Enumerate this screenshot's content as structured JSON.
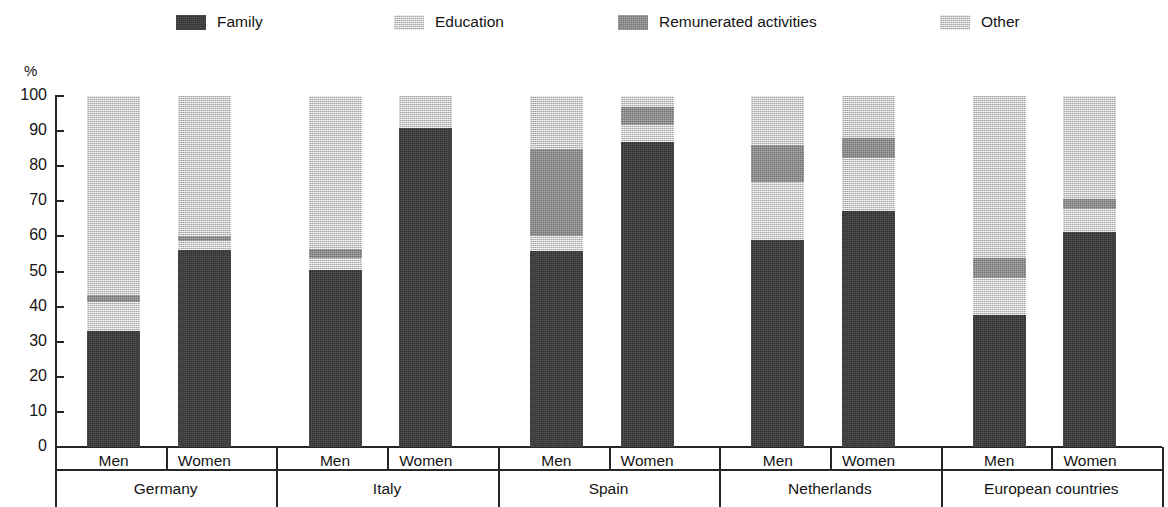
{
  "legend": {
    "items": [
      {
        "label": "Family",
        "color": "#3a3a3a",
        "icon": "legend-swatch-icon",
        "x": 176
      },
      {
        "label": "Education",
        "color": "#d5d5d5",
        "icon": "legend-swatch-icon",
        "x": 394
      },
      {
        "label": "Remunerated activities",
        "color": "#8d8d8d",
        "icon": "legend-swatch-icon",
        "x": 618
      },
      {
        "label": "Other",
        "color": "#d3d3d3",
        "icon": "legend-swatch-icon",
        "x": 940
      }
    ]
  },
  "axis": {
    "unit_label": "%",
    "y_ticks": [
      "100",
      "90",
      "80",
      "70",
      "60",
      "50",
      "40",
      "30",
      "20",
      "10",
      "0"
    ],
    "y_min": 0,
    "y_max": 100
  },
  "x_axis": {
    "sex_labels": [
      "Men",
      "Women",
      "Men",
      "Women",
      "Men",
      "Women",
      "Men",
      "Women",
      "Men",
      "Women"
    ],
    "group_labels": [
      "Germany",
      "Italy",
      "Spain",
      "Netherlands",
      "European countries"
    ]
  },
  "chart_data": {
    "type": "bar",
    "stacked": true,
    "title": "",
    "xlabel": "",
    "ylabel": "%",
    "ylim": [
      0,
      100
    ],
    "grid": false,
    "legend_position": "top",
    "categories": [
      "Germany - Men",
      "Germany - Women",
      "Italy - Men",
      "Italy - Women",
      "Spain - Men",
      "Spain - Women",
      "Netherlands - Men",
      "Netherlands - Women",
      "European countries - Men",
      "European countries - Women"
    ],
    "groups": [
      "Germany",
      "Italy",
      "Spain",
      "Netherlands",
      "European countries"
    ],
    "sexes": [
      "Men",
      "Women"
    ],
    "series": [
      {
        "name": "Family",
        "color": "#3a3a3a",
        "values": [
          33.0,
          56.0,
          50.5,
          90.8,
          55.7,
          86.8,
          59.0,
          67.3,
          37.6,
          61.3
        ]
      },
      {
        "name": "Education",
        "color": "#d5d5d5",
        "values": [
          8.2,
          2.6,
          3.4,
          0.0,
          4.3,
          5.0,
          16.5,
          15.0,
          10.5,
          6.5
        ]
      },
      {
        "name": "Remunerated activities",
        "color": "#8d8d8d",
        "values": [
          2.0,
          1.4,
          2.6,
          0.0,
          25.0,
          5.2,
          10.5,
          5.7,
          5.7,
          2.8
        ]
      },
      {
        "name": "Other",
        "color": "#d3d3d3",
        "values": [
          56.8,
          40.0,
          43.5,
          9.2,
          15.0,
          3.0,
          14.0,
          12.0,
          46.2,
          29.4
        ]
      }
    ]
  }
}
